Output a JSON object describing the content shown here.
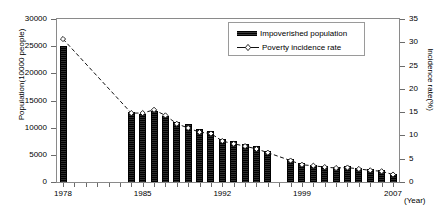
{
  "chart_data": {
    "type": "bar",
    "title": "",
    "xlabel": "(Year)",
    "ylabel": "Population(10000 people)",
    "y2label": "Incidence rate(%)",
    "ylim": [
      0,
      30000
    ],
    "y2lim": [
      0,
      35
    ],
    "grid": false,
    "legend_position": "top-center",
    "x": [
      1978,
      1984,
      1985,
      1986,
      1987,
      1988,
      1989,
      1990,
      1991,
      1992,
      1993,
      1994,
      1995,
      1996,
      1998,
      1999,
      2000,
      2001,
      2002,
      2003,
      2004,
      2005,
      2006,
      2007
    ],
    "xticks": [
      "1978",
      "1985",
      "1992",
      "1999",
      "2007"
    ],
    "xtick_values": [
      1978,
      1985,
      1992,
      1999,
      2007
    ],
    "yticks": [
      "0",
      "5000",
      "10000",
      "15000",
      "20000",
      "25000",
      "30000"
    ],
    "ytick_values": [
      0,
      5000,
      10000,
      15000,
      20000,
      25000,
      30000
    ],
    "y2ticks": [
      "0",
      "5",
      "10",
      "15",
      "20",
      "25",
      "30",
      "35"
    ],
    "y2tick_values": [
      0,
      5,
      10,
      15,
      20,
      25,
      30,
      35
    ],
    "series": [
      {
        "name": "Impoverished population",
        "type": "bar",
        "axis": "left",
        "color": "#111111",
        "values": [
          25000,
          12800,
          12500,
          13100,
          12200,
          11000,
          10600,
          9800,
          9400,
          8000,
          7500,
          7000,
          6540,
          5800,
          4210,
          3412,
          3209,
          2927,
          2820,
          2900,
          2610,
          2365,
          2148,
          1479
        ]
      },
      {
        "name": "Poverty incidence rate",
        "type": "line",
        "axis": "right",
        "color": "#111111",
        "linestyle": "dashed",
        "marker": "diamond",
        "values": [
          30.7,
          14.8,
          14.8,
          15.5,
          14.3,
          12.5,
          11.6,
          10.7,
          10.4,
          8.8,
          8.2,
          7.7,
          7.1,
          6.3,
          4.6,
          3.7,
          3.5,
          3.2,
          3.0,
          3.1,
          2.8,
          2.5,
          2.3,
          1.6
        ]
      }
    ]
  },
  "axes": {
    "left_title": "Population(10000 people)",
    "right_title": "Incidence rate(%)",
    "x_title": "(Year)"
  },
  "legend": {
    "items": [
      {
        "label": "Impoverished population",
        "marker": "bar-swatch"
      },
      {
        "label": "Poverty incidence rate",
        "marker": "dashed-line-diamond"
      }
    ]
  }
}
